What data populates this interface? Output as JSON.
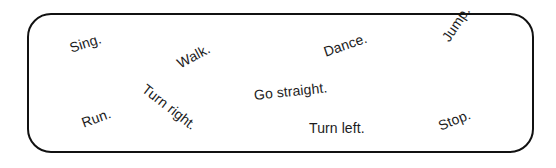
{
  "worksheet": {
    "background_color": "#ffffff",
    "frame": {
      "border_color": "#111111",
      "border_width_px": 2.2,
      "corner_radius_px": 24,
      "fill_color": "#ffffff"
    },
    "text_color": "#1c1c1c",
    "words": [
      {
        "label": "Sing.",
        "name": "word-sing",
        "x": 68,
        "y": 46,
        "rotation_deg": -18,
        "font_size_px": 14
      },
      {
        "label": "Walk.",
        "name": "word-walk",
        "x": 176,
        "y": 62,
        "rotation_deg": -28,
        "font_size_px": 14
      },
      {
        "label": "Dance.",
        "name": "word-dance",
        "x": 322,
        "y": 50,
        "rotation_deg": -19,
        "font_size_px": 14
      },
      {
        "label": "Jump.",
        "name": "word-jump",
        "x": 443,
        "y": 38,
        "rotation_deg": -56,
        "font_size_px": 14
      },
      {
        "label": "Turn right.",
        "name": "word-turn-right",
        "x": 142,
        "y": 85,
        "rotation_deg": 38,
        "font_size_px": 14
      },
      {
        "label": "Go straight.",
        "name": "word-go-straight",
        "x": 252,
        "y": 93,
        "rotation_deg": -6,
        "font_size_px": 14
      },
      {
        "label": "Run.",
        "name": "word-run",
        "x": 80,
        "y": 121,
        "rotation_deg": -20,
        "font_size_px": 14
      },
      {
        "label": "Turn left.",
        "name": "word-turn-left",
        "x": 307,
        "y": 126,
        "rotation_deg": 0,
        "font_size_px": 14
      },
      {
        "label": "Stop.",
        "name": "word-stop",
        "x": 437,
        "y": 124,
        "rotation_deg": -22,
        "font_size_px": 14
      }
    ]
  }
}
